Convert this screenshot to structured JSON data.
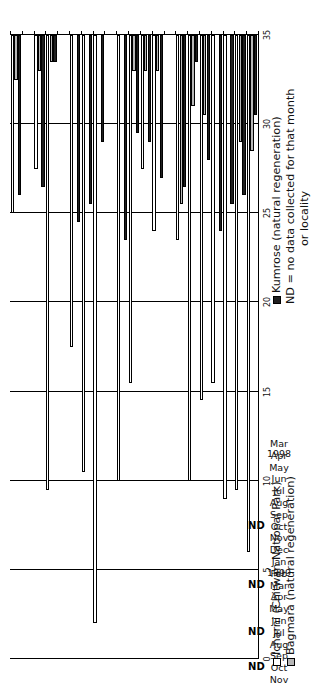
{
  "chart_data": {
    "type": "bar",
    "orientation": "horizontal",
    "title": "",
    "xlabel": "",
    "ylabel": "",
    "ylim": [
      0,
      35
    ],
    "ticks": [
      0,
      5,
      10,
      15,
      20,
      25,
      30,
      35
    ],
    "grid": true,
    "legend_position": "right",
    "categories": [
      "Mar 1998",
      "Apr",
      "May",
      "Jun",
      "Jul",
      "Aug",
      "Sep",
      "Oct",
      "Nov",
      "Dec",
      "Jan 1999",
      "Feb",
      "Mar",
      "Apr",
      "May",
      "Jun",
      "Jul",
      "Aug",
      "Sep",
      "Oct",
      "Nov"
    ],
    "category_labels": [
      {
        "month": "Mar",
        "year": "1998"
      },
      {
        "month": "Apr",
        "year": ""
      },
      {
        "month": "May",
        "year": ""
      },
      {
        "month": "Jun",
        "year": ""
      },
      {
        "month": "Jul",
        "year": ""
      },
      {
        "month": "Aug",
        "year": ""
      },
      {
        "month": "Sep",
        "year": ""
      },
      {
        "month": "Oct",
        "year": ""
      },
      {
        "month": "Nov",
        "year": ""
      },
      {
        "month": "Dec",
        "year": ""
      },
      {
        "month": "Jan",
        "year": "1999"
      },
      {
        "month": "Feb",
        "year": ""
      },
      {
        "month": "Mar",
        "year": ""
      },
      {
        "month": "Apr",
        "year": ""
      },
      {
        "month": "May",
        "year": ""
      },
      {
        "month": "Jun",
        "year": ""
      },
      {
        "month": "Jul",
        "year": ""
      },
      {
        "month": "Aug",
        "year": ""
      },
      {
        "month": "Sep",
        "year": ""
      },
      {
        "month": "Oct",
        "year": ""
      },
      {
        "month": "Nov",
        "year": ""
      }
    ],
    "series": [
      {
        "name": "Icharni (Chitwan National Park)",
        "key": "icharni",
        "color": "#ffffff",
        "values": [
          29.0,
          25.5,
          26.0,
          19.5,
          20.5,
          25.0,
          11.5,
          null,
          11.0,
          7.5,
          19.5,
          25.0,
          null,
          33.0,
          24.5,
          17.5,
          null,
          25.5,
          7.5,
          null,
          10.0
        ]
      },
      {
        "name": "Bagmara (natural regeneration)",
        "key": "bagmara",
        "color": "#b7b7b7",
        "values": [
          6.5,
          6.0,
          0.0,
          0.0,
          4.5,
          4.0,
          9.5,
          null,
          2.0,
          2.0,
          2.0,
          0.0,
          null,
          0.0,
          0.0,
          0.0,
          null,
          1.5,
          2.0,
          null,
          2.5
        ]
      },
      {
        "name": "Kumrose (natural regeneration)",
        "key": "kumrose",
        "color": "#1f1f1f",
        "values": [
          4.5,
          9.0,
          9.5,
          11.0,
          7.0,
          1.5,
          8.5,
          null,
          8.0,
          6.0,
          5.5,
          11.5,
          null,
          6.0,
          9.5,
          10.5,
          null,
          1.5,
          8.5,
          null,
          9.0
        ]
      }
    ],
    "no_data_categories": [
      "Oct 1998",
      "Mar 1999",
      "Jul 1999",
      "Oct 1999"
    ],
    "no_data_marker": "ND"
  },
  "legend": {
    "entries": [
      {
        "label": "Icharni (Chitwan National Park)",
        "swatch": "white"
      },
      {
        "label": "Bagmara (natural regeneration)",
        "swatch": "grey"
      },
      {
        "label": "Kumrose (natural regeneration)",
        "swatch": "black"
      }
    ],
    "note_line1": "ND = no data collected for that month",
    "note_line2": "or locality"
  }
}
